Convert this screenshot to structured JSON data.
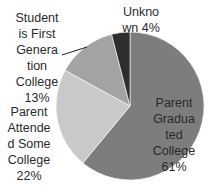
{
  "chart_data": {
    "type": "pie",
    "title": "",
    "categories": [
      "Parent Graduated College",
      "Parent Attended Some College",
      "Student is First Generation College",
      "Unknown"
    ],
    "values": [
      61,
      22,
      13,
      4
    ],
    "unit": "%",
    "colors": [
      "#7d7d7d",
      "#c9c9c9",
      "#a3a3a3",
      "#2e2e2e"
    ],
    "start_angle_deg": 0,
    "direction": "clockwise",
    "legend": "none",
    "data_labels": [
      {
        "lines": [
          "Parent",
          "Gradua",
          "ted",
          "College",
          "61%"
        ]
      },
      {
        "lines": [
          "Parent",
          "Attende",
          "d Some",
          "College",
          "22%"
        ]
      },
      {
        "lines": [
          "Student",
          "is First",
          "Genera",
          "tion",
          "College",
          "13%"
        ]
      },
      {
        "lines": [
          "Unkno",
          "wn 4%"
        ]
      }
    ]
  }
}
